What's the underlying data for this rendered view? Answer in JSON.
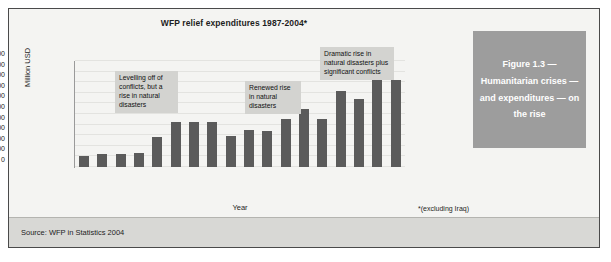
{
  "figure": {
    "source_text": "Source: WFP in Statistics 2004",
    "caption": "Figure 1.3 — Humanitarian crises — and expenditures — on the rise",
    "footnote": "*(excluding Iraq)"
  },
  "colors": {
    "bar": "#5b5b5b",
    "callout_bg": "#d3d3d0",
    "caption_bg": "#9d9d9d",
    "caption_text": "#ffffff",
    "plot_bg": "#f4f4f2",
    "source_band": "#d8d8d5",
    "frame_border": "#4a4a4a"
  },
  "annotations": [
    {
      "id": "callout-1",
      "text": "Levelling off of conflicts, but a rise in natural disasters"
    },
    {
      "id": "callout-2",
      "text": "Renewed rise in natural disasters"
    },
    {
      "id": "callout-3",
      "text": "Dramatic rise in natural disasters plus significant conflicts"
    }
  ],
  "chart_data": {
    "type": "bar",
    "title": "WFP relief expenditures 1987-2004*",
    "xlabel": "Year",
    "ylabel": "Million USD",
    "ylim": [
      0,
      2000
    ],
    "yticks": [
      2000,
      1800,
      1600,
      1400,
      1200,
      1000,
      800,
      600,
      400,
      200,
      0
    ],
    "grid": true,
    "legend": "none",
    "categories": [
      "1987",
      "1988",
      "1989",
      "1990",
      "1991",
      "1992",
      "1993",
      "1994",
      "1995",
      "1996",
      "1997",
      "1998",
      "1999",
      "2000",
      "2001",
      "2002",
      "2003",
      "2004"
    ],
    "values": [
      200,
      240,
      250,
      260,
      560,
      850,
      840,
      855,
      590,
      700,
      685,
      900,
      1090,
      915,
      1440,
      1290,
      1790,
      1650
    ],
    "annotations": [
      {
        "text": "Levelling off of conflicts, but a rise in natural disasters",
        "near_category": "1991"
      },
      {
        "text": "Renewed rise in natural disasters",
        "near_category": "1996"
      },
      {
        "text": "Dramatic rise in natural disasters plus significant conflicts",
        "near_category": "2000"
      }
    ],
    "footnote": "*(excluding Iraq)",
    "source": "Source: WFP in Statistics 2004"
  }
}
